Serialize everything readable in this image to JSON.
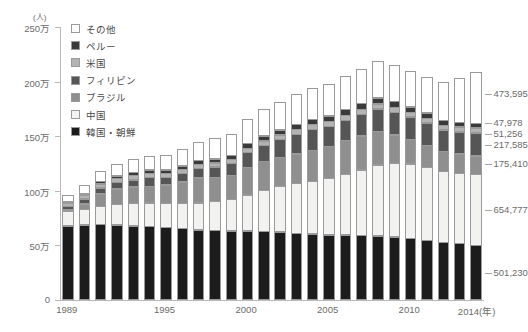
{
  "chart_data": {
    "type": "bar",
    "stacked": true,
    "title": "",
    "xlabel": "年",
    "ylabel": "人",
    "ylim": [
      0,
      2500000
    ],
    "ytick_labels": [
      "0",
      "50万",
      "100万",
      "150万",
      "200万",
      "250万"
    ],
    "ytick_values": [
      0,
      500000,
      1000000,
      1500000,
      2000000,
      2500000
    ],
    "y_unit_label": "(人)",
    "x_unit_label": "(年)",
    "grid": false,
    "legend_position": "top-left",
    "categories": [
      "1989",
      "1990",
      "1991",
      "1992",
      "1993",
      "1994",
      "1995",
      "1996",
      "1997",
      "1998",
      "1999",
      "2000",
      "2001",
      "2002",
      "2003",
      "2004",
      "2005",
      "2006",
      "2007",
      "2008",
      "2009",
      "2010",
      "2011",
      "2012",
      "2013",
      "2014"
    ],
    "xtick_labels": [
      {
        "label": "1989",
        "index": 0
      },
      {
        "label": "1995",
        "index": 6
      },
      {
        "label": "2000",
        "index": 11
      },
      {
        "label": "2005",
        "index": 16
      },
      {
        "label": "2010",
        "index": 21
      },
      {
        "label": "2014",
        "index": 25
      }
    ],
    "series": [
      {
        "name": "韓国・朝鮮",
        "color": "#1c1c1c",
        "values": [
          681838,
          687940,
          693050,
          688144,
          682276,
          676793,
          666376,
          657159,
          645373,
          638828,
          636548,
          635269,
          632405,
          625422,
          613791,
          607419,
          598687,
          598219,
          593489,
          589239,
          578495,
          565989,
          545401,
          530046,
          519740,
          501230
        ]
      },
      {
        "name": "中国",
        "color": "#f2f2f0",
        "values": [
          137499,
          150339,
          171071,
          195334,
          210138,
          218585,
          222991,
          234264,
          252164,
          272230,
          294201,
          335575,
          381225,
          424282,
          462396,
          487570,
          519561,
          560741,
          606889,
          655377,
          680518,
          687156,
          674879,
          652595,
          649078,
          654777
        ]
      },
      {
        "name": "ブラジル",
        "color": "#8f8f8f",
        "values": [
          14528,
          56429,
          119333,
          147803,
          154650,
          159370,
          176440,
          201795,
          233254,
          222217,
          224299,
          254394,
          265962,
          268332,
          274700,
          286557,
          302080,
          312979,
          316967,
          312582,
          267456,
          230552,
          210032,
          190609,
          181317,
          175410
        ]
      },
      {
        "name": "フィリピン",
        "color": "#565656",
        "values": [
          38925,
          49092,
          61837,
          62218,
          73057,
          85968,
          74297,
          84509,
          93265,
          105308,
          115685,
          144871,
          156667,
          169359,
          185237,
          199394,
          187261,
          193488,
          202592,
          210617,
          211716,
          210181,
          209376,
          202974,
          209183,
          217585
        ]
      },
      {
        "name": "米国",
        "color": "#b3b3b3",
        "values": [
          34900,
          38364,
          42498,
          42482,
          42639,
          43320,
          43198,
          44168,
          43690,
          42774,
          42802,
          44856,
          46244,
          47970,
          47836,
          48844,
          49390,
          51321,
          51851,
          52683,
          52149,
          50667,
          49815,
          48357,
          49981,
          51256
        ]
      },
      {
        "name": "ペルー",
        "color": "#3a3a3a",
        "values": [
          4121,
          10279,
          26281,
          31051,
          33169,
          35382,
          36269,
          37099,
          40394,
          41317,
          42773,
          46171,
          50052,
          51772,
          53649,
          55750,
          57728,
          58721,
          59696,
          59723,
          57464,
          54636,
          52843,
          49255,
          48598,
          47978
        ]
      },
      {
        "name": "その他",
        "color": "#ffffff",
        "values": [
          69289,
          82953,
          104730,
          114268,
          124166,
          134861,
          143109,
          156002,
          174105,
          189662,
          199556,
          225120,
          245510,
          263186,
          277888,
          287980,
          296738,
          308910,
          320843,
          337114,
          338452,
          335219,
          335709,
          359796,
          408164,
          473595
        ]
      }
    ],
    "callouts": [
      {
        "value": "473,595",
        "series": "その他"
      },
      {
        "value": "47,978",
        "series": "ペルー"
      },
      {
        "value": "51,256",
        "series": "米国"
      },
      {
        "value": "217,585",
        "series": "フィリピン"
      },
      {
        "value": "175,410",
        "series": "ブラジル"
      },
      {
        "value": "654,777",
        "series": "中国"
      },
      {
        "value": "501,230",
        "series": "韓国・朝鮮"
      }
    ]
  },
  "legend": {
    "items": [
      {
        "label": "その他",
        "color": "#ffffff"
      },
      {
        "label": "ペルー",
        "color": "#3a3a3a"
      },
      {
        "label": "米国",
        "color": "#b3b3b3"
      },
      {
        "label": "フィリピン",
        "color": "#565656"
      },
      {
        "label": "ブラジル",
        "color": "#8f8f8f"
      },
      {
        "label": "中国",
        "color": "#f2f2f0"
      },
      {
        "label": "韓国・朝鮮",
        "color": "#1c1c1c"
      }
    ]
  }
}
